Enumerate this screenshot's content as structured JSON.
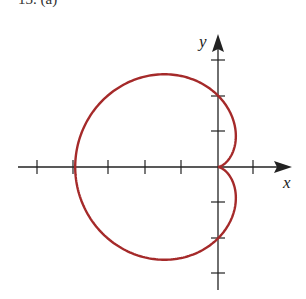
{
  "figure": {
    "label": "13. (a)",
    "x_axis_label": "x",
    "y_axis_label": "y",
    "curve_color": "#a52a2a",
    "axis_color": "#222222"
  },
  "chart_data": {
    "type": "line",
    "title": "13. (a)",
    "equation": "r = 2(1 - cos θ)",
    "xlabel": "x",
    "ylabel": "y",
    "x_ticks": [
      -5,
      -4,
      -3,
      -2,
      -1,
      1
    ],
    "y_ticks": [
      -3,
      -2,
      -1,
      1,
      2,
      3
    ],
    "xlim": [
      -5.5,
      2
    ],
    "ylim": [
      -3.5,
      3.7
    ],
    "key_points": [
      {
        "x": 0,
        "y": 0,
        "note": "cusp at origin"
      },
      {
        "x": -4,
        "y": 0,
        "note": "leftmost point"
      },
      {
        "x": 0,
        "y": 2,
        "note": "y-intercept"
      },
      {
        "x": 0,
        "y": -2,
        "note": "y-intercept"
      }
    ],
    "grid": false
  }
}
